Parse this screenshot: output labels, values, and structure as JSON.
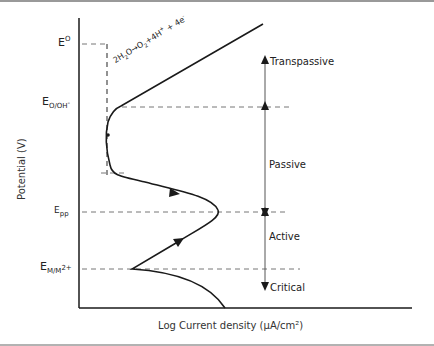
{
  "diagram": {
    "type": "polarization-curve",
    "axes": {
      "y_label": "Potential (V)",
      "x_label": "Log Current density (μA/cm²)"
    },
    "potential_levels": [
      {
        "id": "E0",
        "main": "E",
        "sup": "O",
        "sub": ""
      },
      {
        "id": "E_O_OH",
        "main": "E",
        "sup": "",
        "sub": "O/OH",
        "sub_sup": "-"
      },
      {
        "id": "E_pp",
        "main": "E",
        "sup": "",
        "sub": "pp"
      },
      {
        "id": "E_M_M2",
        "main": "E",
        "sup": "",
        "sub": "M/M",
        "sub_sup": "2+"
      }
    ],
    "reaction": {
      "lhs": "2H",
      "lhs_sub": "2",
      "lhs_tail": "O",
      "arrow": "→",
      "rhs_a": "O",
      "rhs_a_sub": "2",
      "rhs_b": "+4H",
      "rhs_b_sup": "+",
      "rhs_c": " + 4e",
      "rhs_c_sup": "-"
    },
    "regions": {
      "transpassive": "Transpassive",
      "passive": "Passive",
      "active": "Active",
      "critical": "Critical"
    },
    "colors": {
      "curve": "#1a1a1a",
      "axis": "#1a1a1a",
      "dash": "#777777",
      "region_arrow": "#555555",
      "border": "#888888"
    }
  }
}
